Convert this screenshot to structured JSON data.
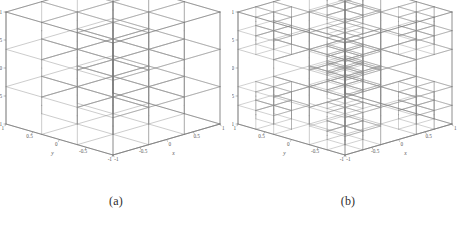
{
  "figure": {
    "background": "#ffffff",
    "line_color": "#8c8c8c",
    "line_color_strong": "#6f6f6f",
    "dot_color": "#9a9a9a",
    "text_color": "#555555"
  },
  "panels": [
    {
      "id": "a",
      "caption": "(a)",
      "title": "",
      "mesh_type": "uniform",
      "base_divisions": 3,
      "refined_regions": [],
      "axes": {
        "x": {
          "label": "x",
          "ticks": [
            "-1",
            "-0.5",
            "0",
            "0.5",
            "1"
          ],
          "values": [
            -1,
            -0.5,
            0,
            0.5,
            1
          ],
          "range": [
            -1,
            1
          ]
        },
        "y": {
          "label": "y",
          "ticks": [
            "1",
            "0.5",
            "0",
            "-0.5",
            "-1"
          ],
          "values": [
            1,
            0.5,
            0,
            -0.5,
            -1
          ],
          "range": [
            -1,
            1
          ]
        },
        "z": {
          "label": "z",
          "ticks": [
            "1",
            "0.5",
            "0",
            "-0.5",
            "-1"
          ],
          "values": [
            1,
            0.5,
            0,
            -0.5,
            -1
          ],
          "range": [
            -1,
            1
          ]
        }
      }
    },
    {
      "id": "b",
      "caption": "(b)",
      "title": "",
      "mesh_type": "adaptive",
      "base_divisions": 3,
      "refined_regions": [
        [
          0,
          0,
          0
        ],
        [
          0,
          0,
          2
        ],
        [
          0,
          2,
          0
        ],
        [
          0,
          2,
          2
        ],
        [
          2,
          0,
          0
        ],
        [
          2,
          0,
          2
        ],
        [
          2,
          2,
          0
        ],
        [
          2,
          2,
          2
        ],
        [
          1,
          1,
          1
        ]
      ],
      "axes": {
        "x": {
          "label": "x",
          "ticks": [
            "-1",
            "-0.5",
            "0",
            "0.5",
            "1"
          ],
          "values": [
            -1,
            -0.5,
            0,
            0.5,
            1
          ],
          "range": [
            -1,
            1
          ]
        },
        "y": {
          "label": "y",
          "ticks": [
            "1",
            "0.5",
            "0",
            "-0.5",
            "-1"
          ],
          "values": [
            1,
            0.5,
            0,
            -0.5,
            -1
          ],
          "range": [
            -1,
            1
          ]
        },
        "z": {
          "label": "z",
          "ticks": [
            "1",
            "0.5",
            "0",
            "-0.5",
            "-1"
          ],
          "values": [
            1,
            0.5,
            0,
            -0.5,
            -1
          ],
          "range": [
            -1,
            1
          ]
        }
      }
    }
  ],
  "chart_data": {
    "type": "mesh3d",
    "title": "",
    "panels": [
      {
        "label": "(a)",
        "grid": "uniform 3x3x3 hexahedral mesh",
        "cells": 27,
        "subdivision_level": 1
      },
      {
        "label": "(b)",
        "grid": "adaptively refined mesh: corner blocks and one interior block split into 2x2x2 sub-cells",
        "cells": 90,
        "subdivision_level": 2
      }
    ],
    "xlabel": "x",
    "ylabel": "y",
    "zlabel": "z",
    "xlim": [
      -1,
      1
    ],
    "ylim": [
      -1,
      1
    ],
    "zlim": [
      -1,
      1
    ],
    "xticks": [
      -1,
      -0.5,
      0,
      0.5,
      1
    ],
    "yticks": [
      -1,
      -0.5,
      0,
      0.5,
      1
    ],
    "zticks": [
      -1,
      -0.5,
      0,
      0.5,
      1
    ],
    "grid": true,
    "legend": false
  }
}
